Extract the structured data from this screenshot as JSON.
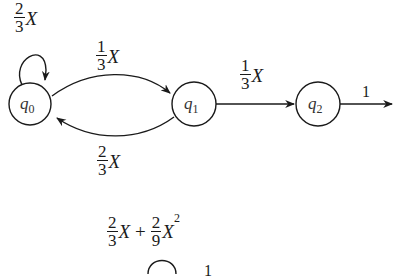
{
  "diagram": {
    "type": "weighted-automaton",
    "states": [
      {
        "id": "q0",
        "name": "q",
        "sub": "0"
      },
      {
        "id": "q1",
        "name": "q",
        "sub": "1"
      },
      {
        "id": "q2",
        "name": "q",
        "sub": "2"
      }
    ],
    "edges": [
      {
        "from": "q0",
        "to": "q0",
        "num": "2",
        "den": "3",
        "var": "X"
      },
      {
        "from": "q0",
        "to": "q1",
        "num": "1",
        "den": "3",
        "var": "X"
      },
      {
        "from": "q1",
        "to": "q0",
        "num": "2",
        "den": "3",
        "var": "X"
      },
      {
        "from": "q1",
        "to": "q2",
        "num": "1",
        "den": "3",
        "var": "X"
      },
      {
        "from": "q2",
        "to": "out",
        "label": "1"
      }
    ],
    "second_automaton": {
      "loop_label": {
        "num1": "2",
        "den1": "3",
        "var1": "X",
        "plus": "+",
        "num2": "2",
        "den2": "9",
        "var2": "X",
        "exp": "2"
      },
      "output_label": "1"
    }
  }
}
